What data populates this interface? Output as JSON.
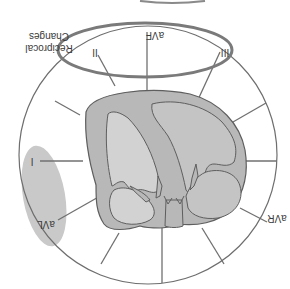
{
  "figure": {
    "orientation": "rotated-180",
    "annotation": {
      "line1": "Reciprocal",
      "line2": "Changes"
    },
    "leads": {
      "aVF": "aVF",
      "II": "II",
      "III": "III",
      "I": "I",
      "aVL": "aVL",
      "aVR": "aVR"
    },
    "highlights": [
      {
        "name": "inferior-leads-highlight",
        "leads": [
          "II",
          "aVF",
          "III"
        ],
        "style": "outline"
      },
      {
        "name": "lateral-leads-highlight",
        "leads": [
          "I",
          "aVL"
        ],
        "style": "filled"
      }
    ],
    "colors": {
      "outline": "#6b6b6b",
      "highlight_outline": "#7a7a7a",
      "highlight_fill": "#c8c8c8",
      "heart_wall": "#b9b9b9",
      "heart_chamber": "#cfcfcf",
      "spoke": "#707070"
    }
  }
}
